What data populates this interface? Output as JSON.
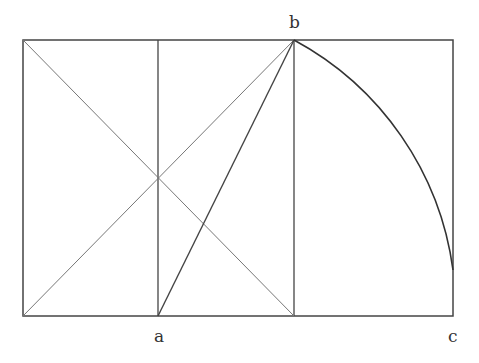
{
  "diagram": {
    "title": "",
    "labels": {
      "a": "a",
      "b": "b",
      "c": "c"
    },
    "colors": {
      "stroke": "#444444",
      "thin_stroke": "#777777",
      "background": "#ffffff"
    }
  }
}
